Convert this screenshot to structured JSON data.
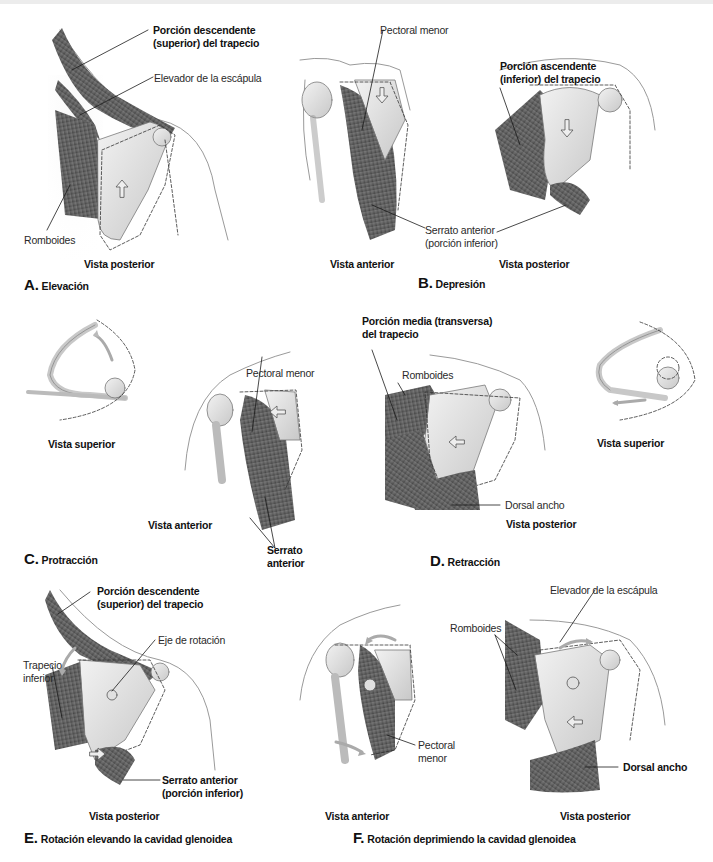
{
  "panels": [
    {
      "letter": "A.",
      "title": "Elevación",
      "views": [
        "Vista posterior"
      ],
      "labels": {
        "trap_sup": [
          "Porción descendente",
          "(superior) del trapecio"
        ],
        "levator": "Elevador de la escápula",
        "rhomboids": "Romboides"
      },
      "arrow": "up"
    },
    {
      "letter": "B.",
      "title": "Depresión",
      "views": [
        "Vista anterior",
        "Vista posterior"
      ],
      "labels": {
        "pec_minor": "Pectoral menor",
        "trap_inf": [
          "Porción ascendente",
          "(inferior) del trapecio"
        ],
        "serratus": [
          "Serrato anterior",
          "(porción inferior)"
        ]
      },
      "arrow": "down"
    },
    {
      "letter": "C.",
      "title": "Protracción",
      "views": [
        "Vista superior",
        "Vista anterior"
      ],
      "labels": {
        "pec_minor": "Pectoral menor",
        "serratus": [
          "Serrato",
          "anterior"
        ]
      },
      "arrow": "forward"
    },
    {
      "letter": "D.",
      "title": "Retracción",
      "views": [
        "Vista posterior",
        "Vista superior"
      ],
      "labels": {
        "trap_mid": [
          "Porción media (transversa)",
          "del trapecio"
        ],
        "rhomboids": "Romboides",
        "lat_dorsi": "Dorsal ancho"
      },
      "arrow": "backward"
    },
    {
      "letter": "E.",
      "title": "Rotación elevando la cavidad glenoidea",
      "views": [
        "Vista posterior"
      ],
      "labels": {
        "trap_sup": [
          "Porción descendente",
          "(superior) del trapecio"
        ],
        "axis": "Eje de rotación",
        "trap_inf": [
          "Trapecio",
          "inferior"
        ],
        "serratus": [
          "Serrato anterior",
          "(porción inferior)"
        ]
      },
      "arrow": "rotate-up"
    },
    {
      "letter": "F.",
      "title": "Rotación deprimiendo la cavidad glenoidea",
      "views": [
        "Vista anterior",
        "Vista posterior"
      ],
      "labels": {
        "levator": "Elevador de la escápula",
        "rhomboids": "Romboides",
        "pec_minor": [
          "Pectoral",
          "menor"
        ],
        "lat_dorsi": "Dorsal ancho"
      },
      "arrow": "rotate-down"
    }
  ],
  "colors": {
    "background": "#ffffff",
    "skin_outline": "#9a9a9a",
    "bone": "#d8d8d8",
    "muscle": "#6f6f6f",
    "muscle_dark": "#4a4a4a",
    "leader_line": "#1a1a1a",
    "arrow_fill": "#bdbdbd"
  }
}
